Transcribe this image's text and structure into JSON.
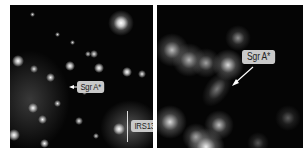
{
  "figure": {
    "left_panel": {
      "description": "Infrared image of the Galactic Center star cluster",
      "labels": {
        "sgr_a": "Sgr A*",
        "irs13": "IRS13"
      }
    },
    "right_panel": {
      "description": "Zoomed, blurred view of the Sgr A* region",
      "labels": {
        "sgr_a": "Sgr A*"
      }
    },
    "colors": {
      "background": "#ffffff",
      "panel_bg": "#050505",
      "label_bg": "#c9c9c9",
      "label_text": "#222222",
      "arrow": "#ffffff"
    }
  }
}
